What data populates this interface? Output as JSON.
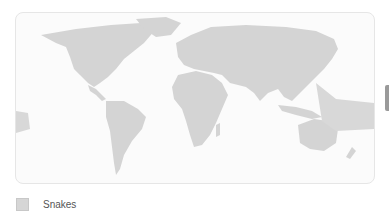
{
  "map": {
    "title": "",
    "land_color": "#d4d4d4",
    "range_color": "#c9c9c9",
    "ocean_color": "#fbfbfb"
  },
  "legend": {
    "items": [
      {
        "label": "Snakes",
        "color": "#d6d6d6"
      }
    ]
  }
}
